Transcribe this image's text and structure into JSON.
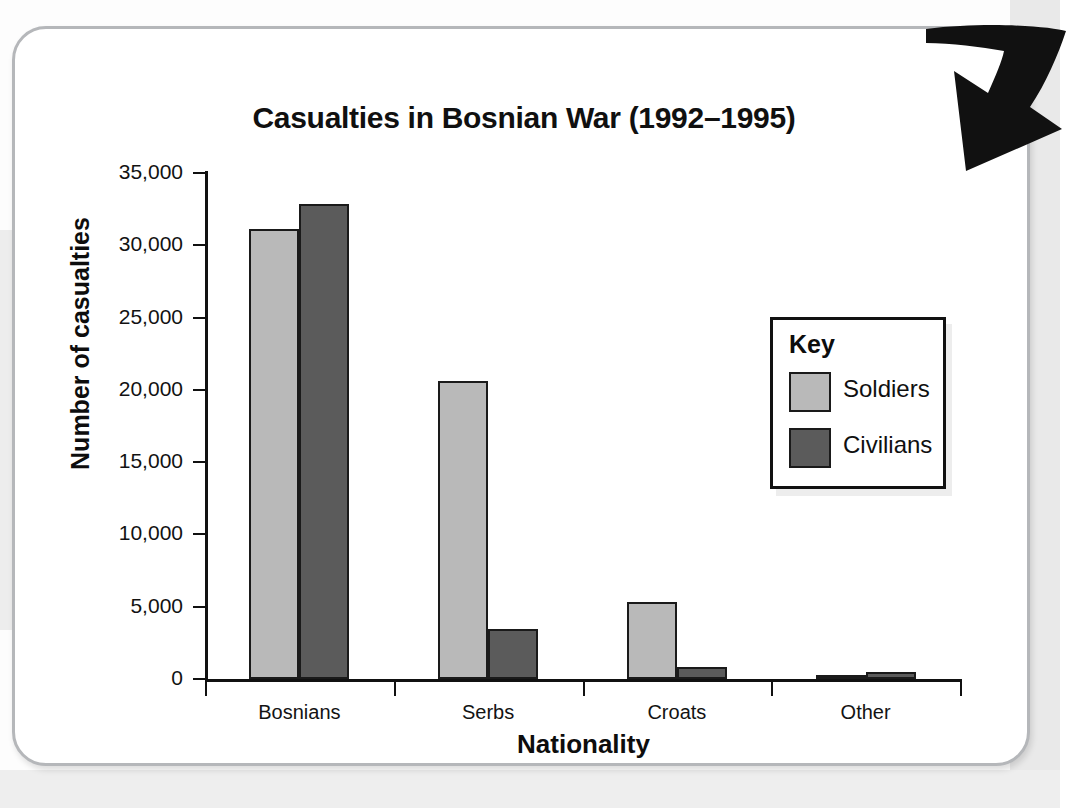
{
  "figure": {
    "title": "Casualties in Bosnian War (1992–1995)",
    "annotation_icon": "curved-down-left-arrow-icon"
  },
  "legend": {
    "title": "Key",
    "entries": [
      {
        "label": "Soldiers",
        "color": "#b9b9b9"
      },
      {
        "label": "Civilians",
        "color": "#5b5b5b"
      }
    ]
  },
  "axes": {
    "y_title": "Number of casualties",
    "x_title": "Nationality",
    "y_ticks": [
      "0",
      "5,000",
      "10,000",
      "15,000",
      "20,000",
      "25,000",
      "30,000",
      "35,000"
    ]
  },
  "chart_data": {
    "type": "bar",
    "title": "Casualties in Bosnian War (1992–1995)",
    "xlabel": "Nationality",
    "ylabel": "Number of casualties",
    "categories": [
      "Bosnians",
      "Serbs",
      "Croats",
      "Other"
    ],
    "series": [
      {
        "name": "Soldiers",
        "color": "#b9b9b9",
        "values": [
          31150,
          20600,
          5300,
          150
        ]
      },
      {
        "name": "Civilians",
        "color": "#5b5b5b",
        "values": [
          32850,
          3460,
          830,
          500
        ]
      }
    ],
    "ylim": [
      0,
      35000
    ],
    "ytick_step": 5000,
    "ytick_labels": [
      "0",
      "5,000",
      "10,000",
      "15,000",
      "20,000",
      "25,000",
      "30,000",
      "35,000"
    ],
    "grid": false,
    "legend_position": "inside-right",
    "legend_title": "Key"
  }
}
